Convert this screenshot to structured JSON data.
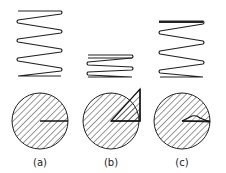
{
  "figure": {
    "panels": [
      {
        "id": "a",
        "label": "(a)",
        "spring_state": "extended",
        "circle_mark": "radius line"
      },
      {
        "id": "b",
        "label": "(b)",
        "spring_state": "compressed",
        "circle_mark": "large wedge"
      },
      {
        "id": "c",
        "label": "(c)",
        "spring_state": "partially extended",
        "circle_mark": "small wedge"
      }
    ]
  },
  "colors": {
    "stroke": "#222222",
    "background": "#ffffff"
  }
}
